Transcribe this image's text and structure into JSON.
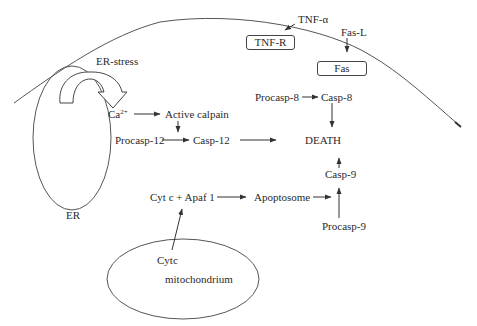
{
  "diagram": {
    "type": "apoptosis-pathway",
    "compartments": {
      "membrane": "cell-membrane-curve",
      "er": "ER",
      "mitochondrion": "mitochondrium"
    },
    "labels": {
      "er_stress": "ER-stress",
      "ca": "Ca",
      "ca_sup": "2+",
      "active_calpain": "Active calpain",
      "procasp12": "Procasp-12",
      "casp12": "Casp-12",
      "tnf_alpha": "TNF-α",
      "tnf_r": "TNF-R",
      "fas_l": "Fas-L",
      "fas": "Fas",
      "procasp8": "Procasp-8",
      "casp8": "Casp-8",
      "death": "DEATH",
      "casp9": "Casp-9",
      "cytc_apaf": "Cyt c + Apaf 1",
      "apoptosome": "Apoptosome",
      "procasp9": "Procasp-9",
      "er": "ER",
      "cytc": "Cytc",
      "mitochondrium": "mitochondrium"
    },
    "edges": [
      {
        "from": "Ca2+",
        "to": "Active calpain"
      },
      {
        "from": "Active calpain",
        "to": "Casp-12"
      },
      {
        "from": "Procasp-12",
        "to": "Casp-12"
      },
      {
        "from": "Casp-12",
        "to": "DEATH"
      },
      {
        "from": "TNF-α",
        "to": "TNF-R"
      },
      {
        "from": "Fas-L",
        "to": "Fas"
      },
      {
        "from": "Procasp-8",
        "to": "Casp-8"
      },
      {
        "from": "Casp-8",
        "to": "DEATH"
      },
      {
        "from": "Casp-9",
        "to": "DEATH"
      },
      {
        "from": "Cytc",
        "to": "Cyt c + Apaf 1"
      },
      {
        "from": "Cyt c + Apaf 1",
        "to": "Apoptosome"
      },
      {
        "from": "Apoptosome",
        "to": "Casp-9"
      },
      {
        "from": "Procasp-9",
        "to": "Casp-9"
      },
      {
        "from": "ER",
        "to": "ER-stress"
      }
    ],
    "colors": {
      "line": "#444444",
      "text": "#2a2a2a",
      "background": "#ffffff"
    }
  }
}
